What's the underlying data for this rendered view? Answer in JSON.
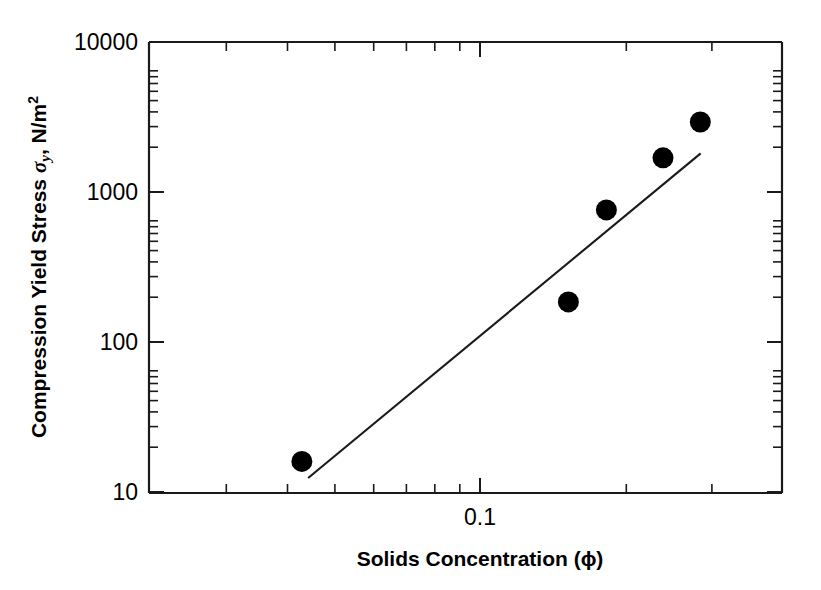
{
  "chart_data": {
    "type": "scatter",
    "title": "",
    "xlabel": "Solids Concentration (ϕ)",
    "ylabel": "Compression Yield Stress σy, N/m2",
    "ylabel_main": "Compression Yield Stress",
    "ylabel_symbol": "σ",
    "ylabel_subscript": "y",
    "ylabel_units": ", N/m",
    "ylabel_unit_exponent": "2",
    "xscale": "log",
    "yscale": "log",
    "xlim": [
      0.0259,
      0.3673
    ],
    "ylim": [
      10,
      10000
    ],
    "grid": false,
    "legend": null,
    "x_tick_labels": [
      "0.1"
    ],
    "x_tick_values": [
      0.1
    ],
    "x_minor_tick_values": [
      0.03,
      0.04,
      0.05,
      0.06,
      0.07,
      0.08,
      0.09,
      0.2,
      0.3
    ],
    "y_tick_labels": [
      "10000",
      "1000",
      "100",
      "10"
    ],
    "y_tick_values": [
      10000,
      1000,
      100,
      10
    ],
    "series": [
      {
        "name": "Compression yield stress data",
        "marker": "filled-circle",
        "marker_color": "#000000",
        "points": [
          {
            "x": 0.043,
            "y": 16
          },
          {
            "x": 0.152,
            "y": 185
          },
          {
            "x": 0.182,
            "y": 760
          },
          {
            "x": 0.238,
            "y": 1690
          },
          {
            "x": 0.284,
            "y": 2930
          }
        ]
      },
      {
        "name": "Fitted trend line",
        "type": "line",
        "line_color": "#1a1a1a",
        "points": [
          {
            "x": 0.0443,
            "y": 12.4
          },
          {
            "x": 0.2845,
            "y": 1810
          }
        ]
      }
    ]
  },
  "axes": {
    "x_title": "Solids Concentration (ϕ)",
    "y_title_text": "Compression Yield Stress"
  }
}
